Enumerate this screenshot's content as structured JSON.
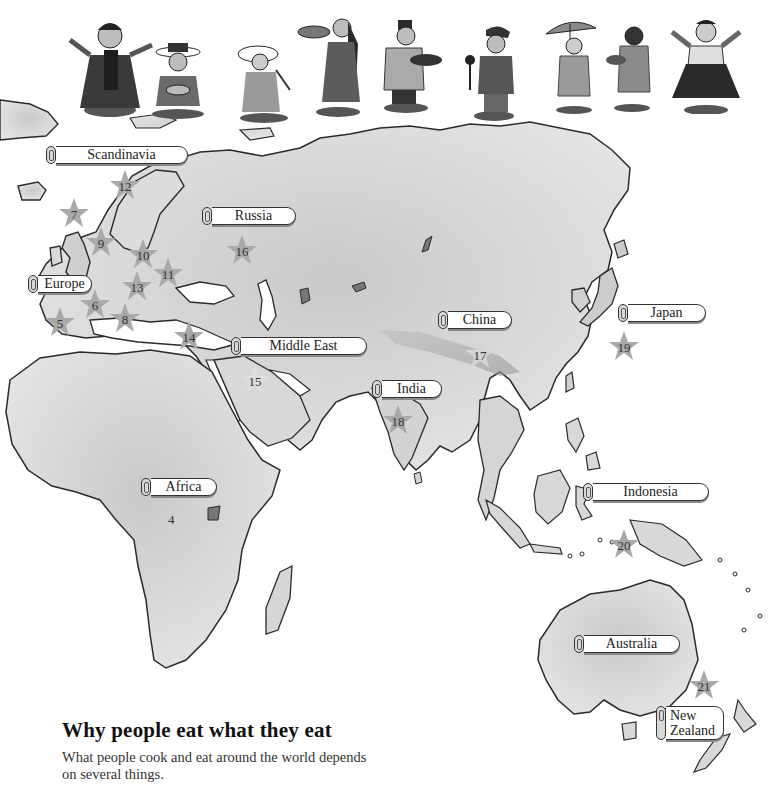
{
  "figures": {
    "count": 11,
    "items": [
      {
        "id": "kid-1",
        "desc": "girl with outstretched arms in embroidered dress"
      },
      {
        "id": "kid-2",
        "desc": "boy in flat brim hat sitting with bowl"
      },
      {
        "id": "kid-3",
        "desc": "child in sun hat kneeling with chopsticks"
      },
      {
        "id": "kid-4",
        "desc": "girl with long hair holding basket"
      },
      {
        "id": "kid-5",
        "desc": "boy in fez with striped robe holding tray"
      },
      {
        "id": "kid-6",
        "desc": "boy in cap holding spoon"
      },
      {
        "id": "kid-7",
        "desc": "girl with parasol"
      },
      {
        "id": "kid-8",
        "desc": "girl holding bowl"
      },
      {
        "id": "kid-9",
        "desc": "girl in folk dress with flowers"
      }
    ]
  },
  "regions": [
    {
      "key": "scandinavia",
      "label": "Scandinavia"
    },
    {
      "key": "russia",
      "label": "Russia"
    },
    {
      "key": "europe",
      "label": "Europe"
    },
    {
      "key": "middle_east",
      "label": "Middle East"
    },
    {
      "key": "china",
      "label": "China"
    },
    {
      "key": "japan",
      "label": "Japan"
    },
    {
      "key": "india",
      "label": "India"
    },
    {
      "key": "africa",
      "label": "Africa"
    },
    {
      "key": "indonesia",
      "label": "Indonesia"
    },
    {
      "key": "australia",
      "label": "Australia"
    },
    {
      "key": "new_zealand",
      "label_line1": "New",
      "label_line2": "Zealand"
    }
  ],
  "markers": [
    {
      "n": "4",
      "star": false
    },
    {
      "n": "5",
      "star": true
    },
    {
      "n": "6",
      "star": true
    },
    {
      "n": "7",
      "star": true
    },
    {
      "n": "8",
      "star": true
    },
    {
      "n": "9",
      "star": true
    },
    {
      "n": "10",
      "star": true
    },
    {
      "n": "11",
      "star": true
    },
    {
      "n": "12",
      "star": true
    },
    {
      "n": "13",
      "star": true
    },
    {
      "n": "14",
      "star": true
    },
    {
      "n": "15",
      "star": true
    },
    {
      "n": "16",
      "star": true
    },
    {
      "n": "17",
      "star": true
    },
    {
      "n": "18",
      "star": true
    },
    {
      "n": "19",
      "star": true
    },
    {
      "n": "20",
      "star": true
    },
    {
      "n": "21",
      "star": true
    }
  ],
  "caption": {
    "title": "Why people eat what they eat",
    "body": "What people cook and eat around the world depends on several things."
  },
  "colors": {
    "land": "#d9d9d9",
    "land_dark": "#b5b5b5",
    "coast": "#2a2a2a",
    "star": "#a9a9a9",
    "background": "#ffffff"
  }
}
